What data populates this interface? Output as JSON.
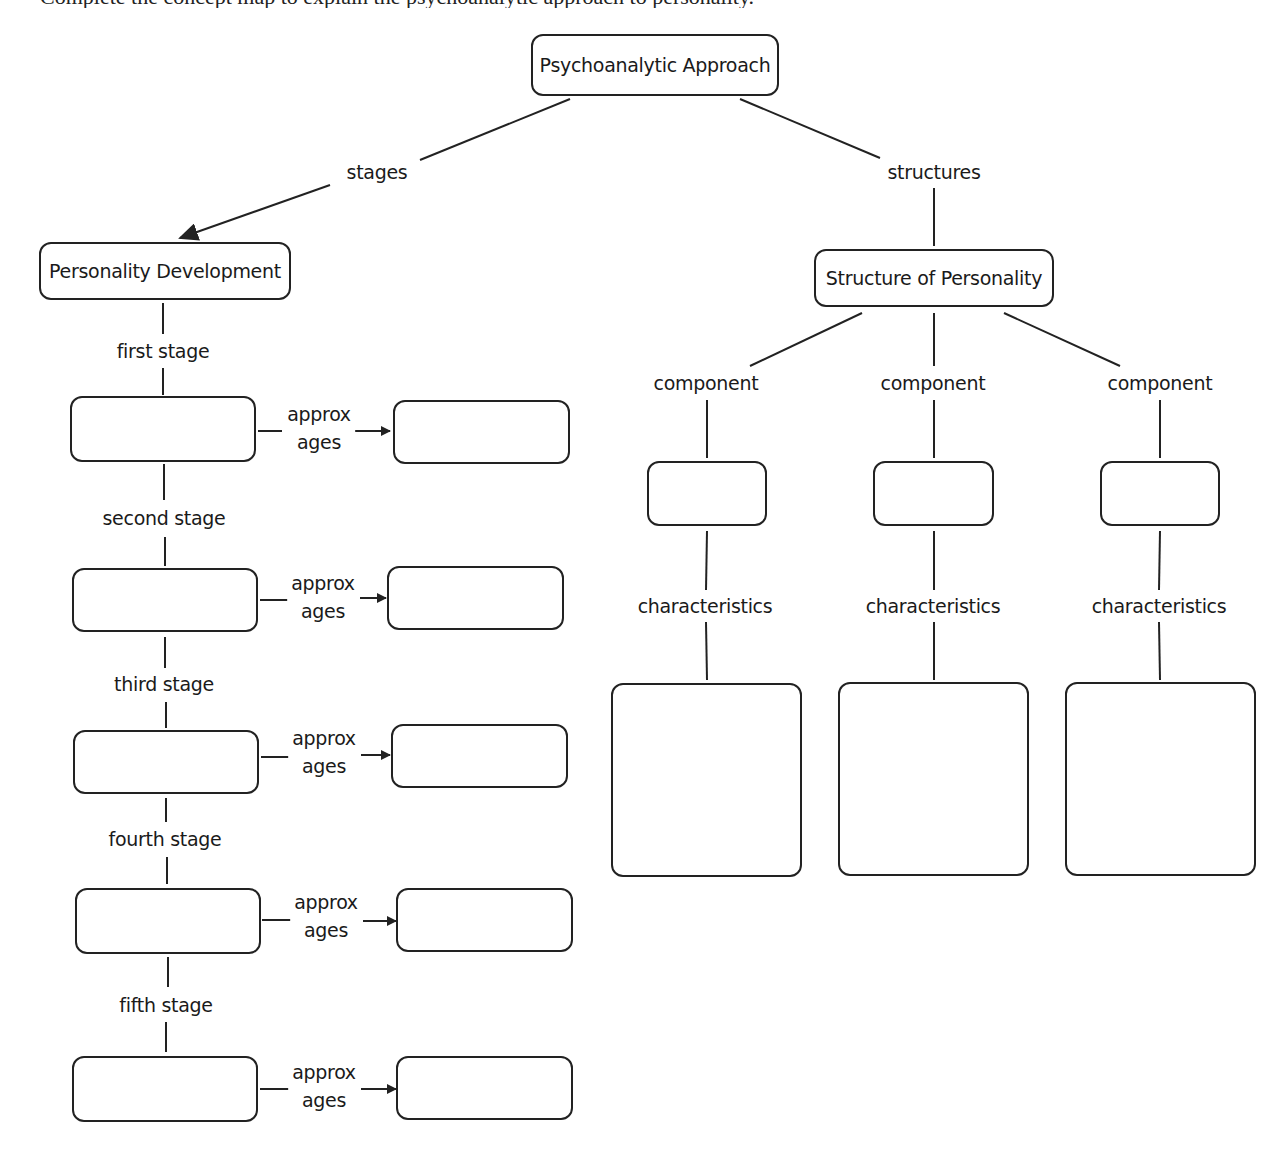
{
  "page": {
    "clipped_header_text": "Complete the concept map to explain the psychoanalytic approach to personality."
  },
  "map": {
    "root": {
      "label": "Psychoanalytic Approach"
    },
    "left_branch": {
      "link_label": "stages",
      "node": {
        "label": "Personality Development"
      },
      "stages": [
        {
          "link_label": "first stage",
          "stage_value": "",
          "ages_link_label_line1": "approx",
          "ages_link_label_line2": "ages",
          "ages_value": ""
        },
        {
          "link_label": "second stage",
          "stage_value": "",
          "ages_link_label_line1": "approx",
          "ages_link_label_line2": "ages",
          "ages_value": ""
        },
        {
          "link_label": "third stage",
          "stage_value": "",
          "ages_link_label_line1": "approx",
          "ages_link_label_line2": "ages",
          "ages_value": ""
        },
        {
          "link_label": "fourth stage",
          "stage_value": "",
          "ages_link_label_line1": "approx",
          "ages_link_label_line2": "ages",
          "ages_value": ""
        },
        {
          "link_label": "fifth stage",
          "stage_value": "",
          "ages_link_label_line1": "approx",
          "ages_link_label_line2": "ages",
          "ages_value": ""
        }
      ]
    },
    "right_branch": {
      "link_label": "structures",
      "node": {
        "label": "Structure of Personality"
      },
      "components": [
        {
          "link_label": "component",
          "component_value": "",
          "char_link_label": "characteristics",
          "characteristics_value": ""
        },
        {
          "link_label": "component",
          "component_value": "",
          "char_link_label": "characteristics",
          "characteristics_value": ""
        },
        {
          "link_label": "component",
          "component_value": "",
          "char_link_label": "characteristics",
          "characteristics_value": ""
        }
      ]
    },
    "colors": {
      "stroke": "#222222",
      "background": "#ffffff",
      "text": "#1a1a1a"
    }
  }
}
